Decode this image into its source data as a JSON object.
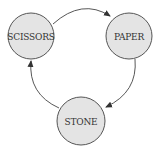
{
  "diagram": {
    "type": "cycle",
    "colors": {
      "node_fill": "#e4e4e4",
      "node_stroke": "#555555",
      "edge": "#444444",
      "text": "#333333",
      "background": "#ffffff"
    },
    "nodes": [
      {
        "id": "scissors",
        "label": "SCISSORS",
        "cx": 31,
        "cy": 36,
        "r": 23
      },
      {
        "id": "paper",
        "label": "PAPER",
        "cx": 129,
        "cy": 36,
        "r": 23
      },
      {
        "id": "stone",
        "label": "STONE",
        "cx": 81,
        "cy": 121,
        "r": 24
      }
    ],
    "edges": [
      {
        "from": "scissors",
        "to": "paper"
      },
      {
        "from": "paper",
        "to": "stone"
      },
      {
        "from": "stone",
        "to": "scissors"
      }
    ]
  }
}
